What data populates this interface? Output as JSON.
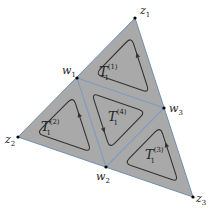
{
  "diagram": {
    "colors": {
      "fill": "#a9a9a9",
      "edge": "#6f8fb3",
      "inner_edge": "#7f9cc0",
      "loop": "#333333",
      "vertex": "#000000",
      "text": "#222222"
    },
    "vertices": [
      {
        "id": "z1",
        "name": "z",
        "sub": "1"
      },
      {
        "id": "z2",
        "name": "z",
        "sub": "2"
      },
      {
        "id": "z3",
        "name": "z",
        "sub": "3"
      },
      {
        "id": "w1",
        "name": "w",
        "sub": "1"
      },
      {
        "id": "w2",
        "name": "w",
        "sub": "2"
      },
      {
        "id": "w3",
        "name": "w",
        "sub": "3"
      }
    ],
    "subtriangles": [
      {
        "id": "T1",
        "name": "T",
        "sub": "1",
        "sup": "(1)",
        "vertices": [
          "z1",
          "w1",
          "w3"
        ],
        "orientation": "counterclockwise"
      },
      {
        "id": "T2",
        "name": "T",
        "sub": "1",
        "sup": "(2)",
        "vertices": [
          "w1",
          "z2",
          "w2"
        ],
        "orientation": "counterclockwise"
      },
      {
        "id": "T3",
        "name": "T",
        "sub": "1",
        "sup": "(3)",
        "vertices": [
          "w3",
          "w2",
          "z3"
        ],
        "orientation": "counterclockwise"
      },
      {
        "id": "T4",
        "name": "T",
        "sub": "1",
        "sup": "(4)",
        "vertices": [
          "w1",
          "w2",
          "w3"
        ],
        "orientation": "counterclockwise"
      }
    ]
  }
}
